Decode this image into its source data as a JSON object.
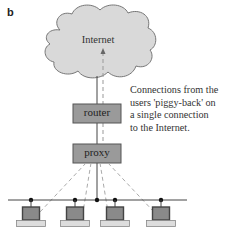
{
  "panel_label": "b",
  "diagram": {
    "cloud": {
      "label": "Internet",
      "fill": "#d9d9d9",
      "stroke": "#777777"
    },
    "router": {
      "label": "router",
      "fill": "#9a9a9a",
      "stroke": "#555555"
    },
    "proxy": {
      "label": "proxy",
      "fill": "#9a9a9a",
      "stroke": "#555555"
    },
    "caption_lines": [
      "Connections from the",
      "users 'piggy-back' on",
      "a single connection",
      "to the Internet."
    ],
    "computers": [
      {
        "id": "pc-1"
      },
      {
        "id": "pc-2"
      },
      {
        "id": "pc-3"
      },
      {
        "id": "pc-4"
      }
    ],
    "colors": {
      "dashed_connection": "#aaaaaa",
      "solid_link": "#444444",
      "bus": "#444444",
      "monitor_frame": "#444444",
      "monitor_screen": "#8a8a8a",
      "computer_base": "#dddddd"
    }
  }
}
